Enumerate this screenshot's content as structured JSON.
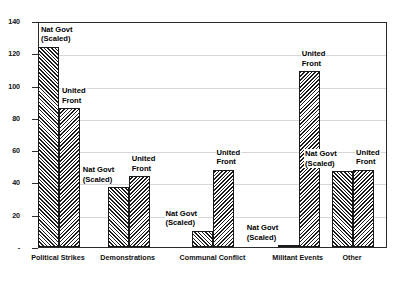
{
  "chart_data": {
    "type": "bar",
    "title": "",
    "subtitle": "",
    "xlabel": "",
    "ylabel": "",
    "categories": [
      "Political Strikes",
      "Demonstrations",
      "Communal Conflict",
      "Militant Events",
      "Other"
    ],
    "series": [
      {
        "name": "Nat Govt (Scaled)",
        "label_line1": "Nat Govt",
        "label_line2": "(Scaled)",
        "values": [
          124,
          37,
          10,
          1,
          47
        ]
      },
      {
        "name": "United Front",
        "label_line1": "United",
        "label_line2": "Front",
        "values": [
          86,
          44,
          48,
          109,
          48
        ]
      }
    ],
    "ylim": [
      0,
      140
    ],
    "yticks": [
      0,
      20,
      40,
      60,
      80,
      100,
      120,
      140
    ],
    "ytick_labels": [
      "-",
      "20",
      "40",
      "60",
      "80",
      "100",
      "120",
      "140"
    ],
    "grid": true,
    "legend": "none (labels annotated on bars)",
    "annotations": [
      {
        "text": "Nat Govt (Scaled)",
        "category": "Political Strikes"
      },
      {
        "text": "United Front",
        "category": "Political Strikes"
      },
      {
        "text": "Nat Govt (Scaled)",
        "category": "Demonstrations"
      },
      {
        "text": "United Front",
        "category": "Demonstrations"
      },
      {
        "text": "Nat Govt (Scaled)",
        "category": "Communal Conflict"
      },
      {
        "text": "United Front",
        "category": "Communal Conflict"
      },
      {
        "text": "Nat Govt (Scaled)",
        "category": "Militant Events"
      },
      {
        "text": "United Front",
        "category": "Militant Events"
      },
      {
        "text": "Nat Govt (Scaled)",
        "category": "Other"
      },
      {
        "text": "United Front",
        "category": "Other"
      }
    ],
    "colors": {
      "bar_fill": "#8e8e8e",
      "bar_edge": "#1a1a1a",
      "grid": "#d6d6d6",
      "axis": "#2b2b2b",
      "text": "#101010"
    }
  }
}
